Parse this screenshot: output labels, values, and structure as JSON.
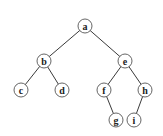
{
  "diagram": {
    "type": "binary-tree",
    "nodes": [
      {
        "id": "a",
        "label": "a",
        "x": 85,
        "y": 26
      },
      {
        "id": "b",
        "label": "b",
        "x": 44,
        "y": 61
      },
      {
        "id": "e",
        "label": "e",
        "x": 125,
        "y": 61
      },
      {
        "id": "c",
        "label": "c",
        "x": 21,
        "y": 90
      },
      {
        "id": "d",
        "label": "d",
        "x": 62,
        "y": 90
      },
      {
        "id": "f",
        "label": "f",
        "x": 104,
        "y": 90
      },
      {
        "id": "h",
        "label": "h",
        "x": 145,
        "y": 90
      },
      {
        "id": "g",
        "label": "g",
        "x": 116,
        "y": 120
      },
      {
        "id": "i",
        "label": "i",
        "x": 134,
        "y": 120
      }
    ],
    "edges": [
      {
        "from": "a",
        "to": "b"
      },
      {
        "from": "a",
        "to": "e"
      },
      {
        "from": "b",
        "to": "c"
      },
      {
        "from": "b",
        "to": "d"
      },
      {
        "from": "e",
        "to": "f"
      },
      {
        "from": "e",
        "to": "h"
      },
      {
        "from": "f",
        "to": "g"
      },
      {
        "from": "h",
        "to": "i"
      }
    ],
    "node_radius": 7
  }
}
